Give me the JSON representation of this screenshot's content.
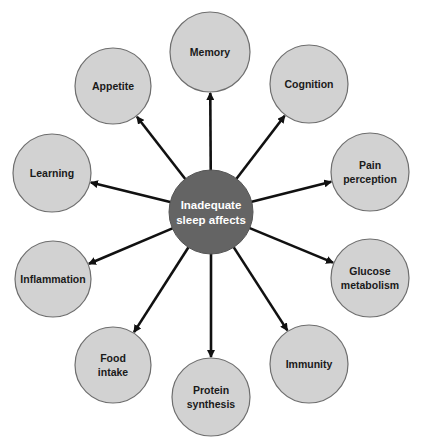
{
  "diagram": {
    "type": "hub-and-spoke",
    "colors": {
      "background": "#ffffff",
      "center_fill": "#646464",
      "center_stroke": "#555555",
      "center_text": "#ffffff",
      "node_fill": "#d2d2d2",
      "node_stroke": "#6e6e6e",
      "node_text": "#1a1a1a",
      "arrow": "#111111"
    },
    "center": {
      "label_lines": [
        "Inadequate",
        "sleep affects"
      ],
      "cx": 211,
      "cy": 212,
      "r": 42
    },
    "nodes": [
      {
        "id": "memory",
        "label_lines": [
          "Memory"
        ],
        "cx": 210,
        "cy": 52,
        "r": 40
      },
      {
        "id": "cognition",
        "label_lines": [
          "Cognition"
        ],
        "cx": 309,
        "cy": 84,
        "r": 39
      },
      {
        "id": "pain-perception",
        "label_lines": [
          "Pain",
          "perception"
        ],
        "cx": 370,
        "cy": 172,
        "r": 39
      },
      {
        "id": "glucose-metabolism",
        "label_lines": [
          "Glucose",
          "metabolism"
        ],
        "cx": 370,
        "cy": 278,
        "r": 39
      },
      {
        "id": "immunity",
        "label_lines": [
          "Immunity"
        ],
        "cx": 309,
        "cy": 364,
        "r": 39
      },
      {
        "id": "protein-synthesis",
        "label_lines": [
          "Protein",
          "synthesis"
        ],
        "cx": 211,
        "cy": 397,
        "r": 39
      },
      {
        "id": "food-intake",
        "label_lines": [
          "Food",
          "intake"
        ],
        "cx": 113,
        "cy": 365,
        "r": 38
      },
      {
        "id": "inflammation",
        "label_lines": [
          "Inflammation"
        ],
        "cx": 53,
        "cy": 279,
        "r": 38
      },
      {
        "id": "learning",
        "label_lines": [
          "Learning"
        ],
        "cx": 52,
        "cy": 173,
        "r": 39
      },
      {
        "id": "appetite",
        "label_lines": [
          "Appetite"
        ],
        "cx": 113,
        "cy": 86,
        "r": 38
      }
    ]
  }
}
